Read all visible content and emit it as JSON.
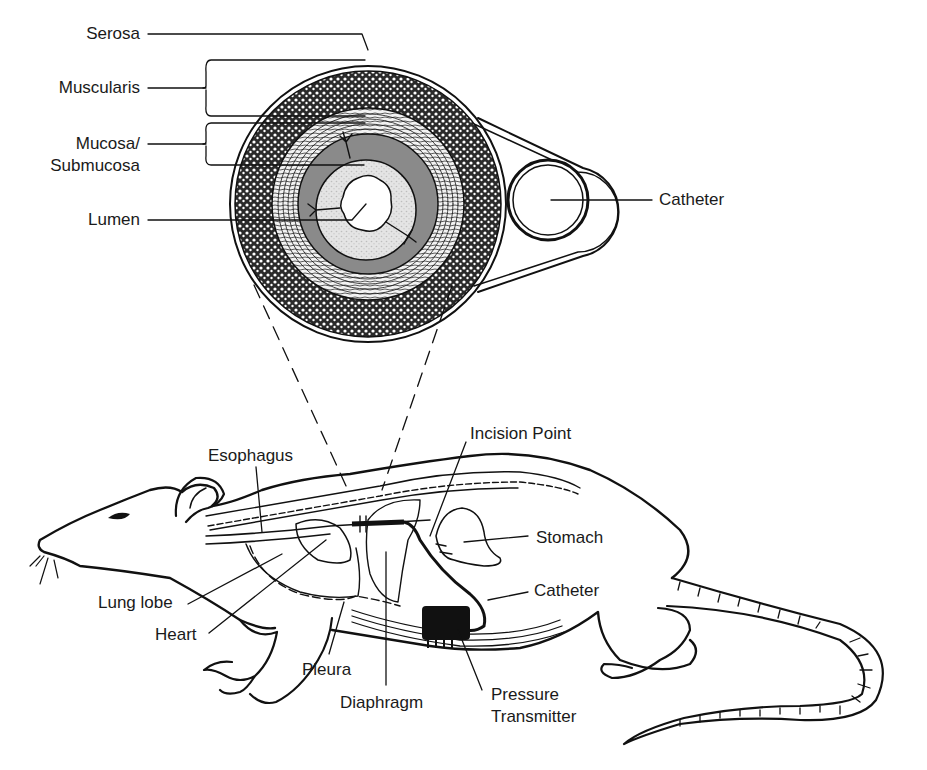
{
  "diagram": {
    "colors": {
      "ink": "#111111",
      "background": "#ffffff",
      "mucosa_gray": "#8a8a8a",
      "submucosa_light": "#d9d9d9",
      "transmitter": "#111111"
    },
    "cross_section": {
      "labels": {
        "serosa": "Serosa",
        "muscularis": "Muscularis",
        "mucosa_line1": "Mucosa/",
        "mucosa_line2": "Submucosa",
        "lumen": "Lumen",
        "catheter": "Catheter"
      }
    },
    "rat": {
      "labels": {
        "esophagus": "Esophagus",
        "incision_point": "Incision Point",
        "stomach": "Stomach",
        "catheter": "Catheter",
        "lung_lobe": "Lung lobe",
        "heart": "Heart",
        "pleura": "Pleura",
        "diaphragm": "Diaphragm",
        "pressure_transmitter_line1": "Pressure",
        "pressure_transmitter_line2": "Transmitter"
      }
    }
  }
}
